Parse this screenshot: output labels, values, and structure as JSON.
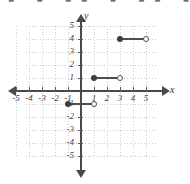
{
  "top_strip": {
    "clipped_text": "■ ■ ■■ ■ ■■ ■"
  },
  "axes": {
    "x_label": "x",
    "y_label": "y",
    "x_ticks": [
      "-5",
      "-4",
      "-3",
      "-2",
      "-1",
      "1",
      "2",
      "3",
      "4",
      "5"
    ],
    "y_ticks": [
      "5",
      "4",
      "3",
      "2",
      "1",
      "-1",
      "-2",
      "-3",
      "-4",
      "-5"
    ]
  },
  "colors": {
    "axis": "#4a4a4a",
    "grid": "#cccccc",
    "data": "#4f4f4f",
    "background": "#ffffff"
  },
  "chart_data": {
    "type": "line",
    "title": "",
    "xlabel": "x",
    "ylabel": "y",
    "xlim": [
      -5,
      5
    ],
    "ylim": [
      -5,
      5
    ],
    "grid": true,
    "legend": "none",
    "segments": [
      {
        "name": "segment-lower",
        "y": -1,
        "x_start": -1,
        "x_end": 1,
        "left_endpoint": "closed",
        "right_endpoint": "open"
      },
      {
        "name": "segment-middle",
        "y": 1,
        "x_start": 1,
        "x_end": 3,
        "left_endpoint": "closed",
        "right_endpoint": "open"
      },
      {
        "name": "segment-upper",
        "y": 4,
        "x_start": 3,
        "x_end": 5,
        "left_endpoint": "closed",
        "right_endpoint": "open"
      }
    ]
  }
}
